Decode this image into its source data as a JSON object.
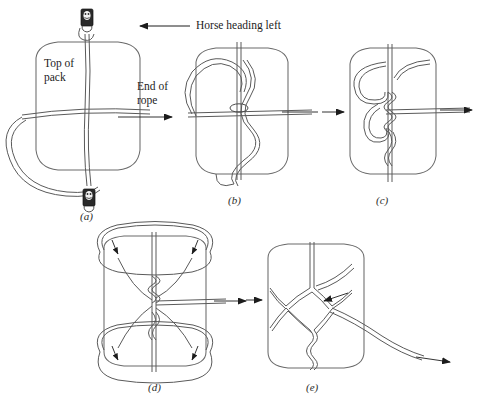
{
  "figure": {
    "type": "instructional-line-diagram",
    "background_color": "#ffffff",
    "line_color": "#555555",
    "text_color": "#1c1c1c",
    "panel_count": 5
  },
  "annotations": {
    "heading_note": "Horse heading left",
    "top_of_pack_line1": "Top of",
    "top_of_pack_line2": "pack",
    "end_of_rope_line1": "End of",
    "end_of_rope_line2": "rope"
  },
  "panels": [
    {
      "id": "a",
      "label": "(a)"
    },
    {
      "id": "b",
      "label": "(b)"
    },
    {
      "id": "c",
      "label": "(c)"
    },
    {
      "id": "d",
      "label": "(d)"
    },
    {
      "id": "e",
      "label": "(e)"
    }
  ],
  "icons": {
    "cinch_top": "cinch-buckle-icon",
    "cinch_bottom": "cinch-buckle-icon",
    "heading_arrow": "arrow-left-icon",
    "rope_end_arrow": "arrow-right-icon",
    "panel_c_in_arrow": "arrow-right-icon",
    "panel_c_out_arrow": "arrow-right-icon",
    "panel_d_out_arrow": "arrow-right-icon",
    "panel_e_pointer_arrow": "arrow-left-pointing-icon",
    "panel_e_out_arrow": "arrow-right-icon",
    "loop_direction_arrows": "curved-direction-arrow-icon"
  }
}
